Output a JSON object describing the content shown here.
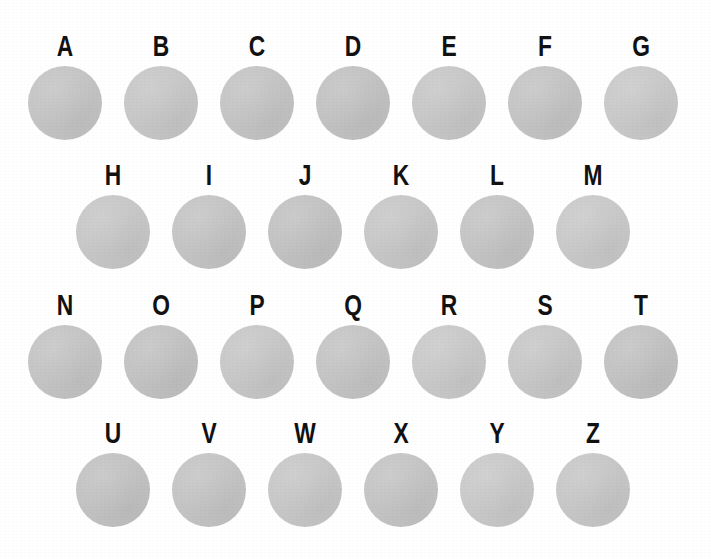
{
  "figure": {
    "background_color": "#ffffff",
    "label_color": "#111111",
    "disc_color": "#c5c5c5",
    "rows": [
      {
        "row_name": "row-1",
        "top": 31,
        "x_offset": 17,
        "items": [
          {
            "label": "A",
            "tone": "disc-t1"
          },
          {
            "label": "B",
            "tone": "disc-t2"
          },
          {
            "label": "C",
            "tone": "disc-t1"
          },
          {
            "label": "D",
            "tone": "disc-t3"
          },
          {
            "label": "E",
            "tone": "disc-t2"
          },
          {
            "label": "F",
            "tone": "disc-t1"
          },
          {
            "label": "G",
            "tone": "disc-t4"
          }
        ]
      },
      {
        "row_name": "row-2",
        "top": 160,
        "x_offset": 65,
        "items": [
          {
            "label": "H",
            "tone": "disc-t2"
          },
          {
            "label": "I",
            "tone": "disc-t1"
          },
          {
            "label": "J",
            "tone": "disc-t3"
          },
          {
            "label": "K",
            "tone": "disc-t2"
          },
          {
            "label": "L",
            "tone": "disc-t1"
          },
          {
            "label": "M",
            "tone": "disc-t4"
          }
        ]
      },
      {
        "row_name": "row-3",
        "top": 290,
        "x_offset": 17,
        "items": [
          {
            "label": "N",
            "tone": "disc-t1"
          },
          {
            "label": "O",
            "tone": "disc-t3"
          },
          {
            "label": "P",
            "tone": "disc-t2"
          },
          {
            "label": "Q",
            "tone": "disc-t1"
          },
          {
            "label": "R",
            "tone": "disc-t4"
          },
          {
            "label": "S",
            "tone": "disc-t2"
          },
          {
            "label": "T",
            "tone": "disc-t3"
          }
        ]
      },
      {
        "row_name": "row-4",
        "top": 418,
        "x_offset": 65,
        "items": [
          {
            "label": "U",
            "tone": "disc-t3"
          },
          {
            "label": "V",
            "tone": "disc-t1"
          },
          {
            "label": "W",
            "tone": "disc-t2"
          },
          {
            "label": "X",
            "tone": "disc-t1"
          },
          {
            "label": "Y",
            "tone": "disc-t4"
          },
          {
            "label": "Z",
            "tone": "disc-t2"
          }
        ]
      }
    ]
  }
}
